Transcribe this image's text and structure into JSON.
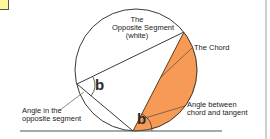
{
  "diagram": {
    "labels": {
      "opposite_segment_line1": "The",
      "opposite_segment_line2": "Opposite Segment",
      "opposite_segment_line3": "(white)",
      "chord": "The Chord",
      "angle_opposite_line1": "Angle in the",
      "angle_opposite_line2": "opposite segment",
      "angle_chord_tangent_line1": "Angle between",
      "angle_chord_tangent_line2": "chord and tangent",
      "angle_symbol_inscribed": "b",
      "angle_symbol_tangent": "b"
    },
    "colors": {
      "segment_fill": "#f79a55",
      "stroke": "#3a3a3a",
      "note_box": "#fff59a",
      "background": "#ffffff"
    }
  }
}
